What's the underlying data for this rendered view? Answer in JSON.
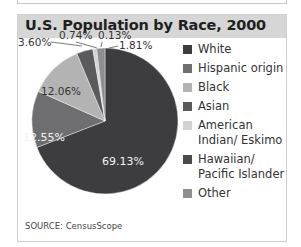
{
  "chart_data": {
    "type": "pie",
    "title": "U.S. Population by Race, 2000",
    "categories": [
      "White",
      "Hispanic origin",
      "Black",
      "Asian",
      "American Indian/ Eskimo",
      "Hawaiian/ Pacific Islander",
      "Other"
    ],
    "values": [
      69.13,
      12.55,
      12.06,
      3.6,
      0.74,
      0.13,
      1.81
    ],
    "value_labels": [
      "69.13%",
      "12.55%",
      "12.06%",
      "3.60%",
      "0.74%",
      "0.13%",
      "1.81%"
    ],
    "colors": [
      "#3d3d3f",
      "#6e6e70",
      "#b3b3b3",
      "#5a5a5c",
      "#d2d2d2",
      "#4a4a4c",
      "#8e8e90"
    ],
    "legend_position": "right",
    "source": "SOURCE: CensusScope"
  },
  "header": {
    "title": "U.S. Population by Race, 2000"
  },
  "legend": {
    "items": [
      {
        "label": "White",
        "color": "#3d3d3f"
      },
      {
        "label": "Hispanic origin",
        "color": "#6e6e70"
      },
      {
        "label": "Black",
        "color": "#b3b3b3"
      },
      {
        "label": "Asian",
        "color": "#5a5a5c"
      },
      {
        "label": "American Indian/ Eskimo",
        "color": "#d2d2d2"
      },
      {
        "label": "Hawaiian/ Pacific Islander",
        "color": "#4a4a4c"
      },
      {
        "label": "Other",
        "color": "#8e8e90"
      }
    ]
  },
  "labels": {
    "white": "69.13%",
    "hispanic": "12.55%",
    "black": "12.06%",
    "asian": "3.60%",
    "amindian": "0.74%",
    "hawaiian": "0.13%",
    "other": "1.81%"
  },
  "footer": {
    "source": "SOURCE: CensusScope"
  }
}
